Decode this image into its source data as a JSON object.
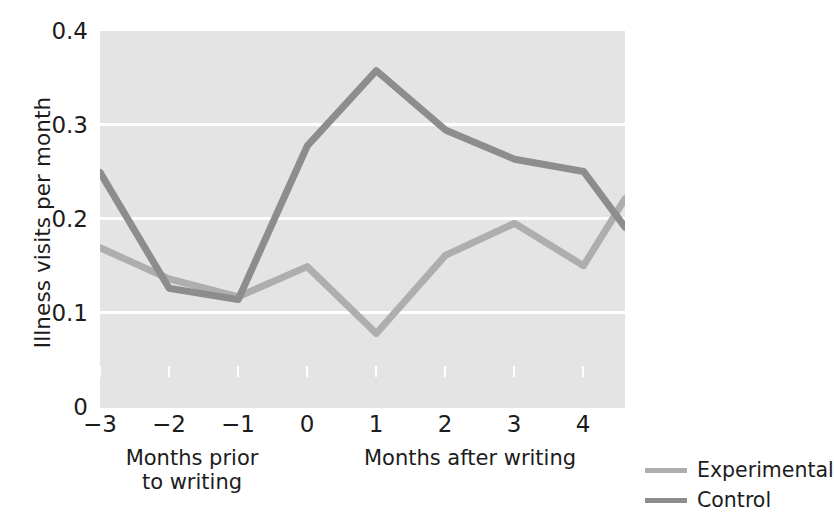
{
  "chart_data": {
    "type": "line",
    "title": "",
    "xlabel": "",
    "ylabel": "Illness visits per month",
    "x": [
      -3,
      -2,
      -1,
      0,
      1,
      2,
      3,
      4,
      4.6
    ],
    "x_tick_labels": [
      "−3",
      "−2",
      "−1",
      "0",
      "1",
      "2",
      "3",
      "4"
    ],
    "x_tick_values": [
      -3,
      -2,
      -1,
      0,
      1,
      2,
      3,
      4
    ],
    "y_tick_labels": [
      "0",
      "0.1",
      "0.2",
      "0.3",
      "0.4"
    ],
    "y_tick_values": [
      0,
      0.1,
      0.2,
      0.3,
      0.4
    ],
    "ylim": [
      0,
      0.4
    ],
    "xlim": [
      -3,
      4.6
    ],
    "grid": "horizontal-white-gridlines-at-0.1-0.2-0.3",
    "legend_position": "right-outside-bottom",
    "plot_background": "#e4e4e4",
    "series": [
      {
        "name": "Experimental",
        "color": "#aeaeae",
        "values": [
          0.17,
          0.137,
          0.118,
          0.15,
          0.079,
          0.162,
          0.196,
          0.151,
          0.222
        ]
      },
      {
        "name": "Control",
        "color": "#8d8d8d",
        "values": [
          0.25,
          0.127,
          0.115,
          0.278,
          0.358,
          0.295,
          0.264,
          0.251,
          0.192
        ]
      }
    ],
    "annotations": [
      {
        "text": "Months prior to writing",
        "region": "x from -3 to 0"
      },
      {
        "text": "Months after writing",
        "region": "x from 0 to 4.6"
      }
    ]
  },
  "axes": {
    "y_label": "Illness visits per month",
    "y_ticks": [
      "0.4",
      "0.3",
      "0.2",
      "0.1",
      "0"
    ],
    "x_ticks": [
      "−3",
      "−2",
      "−1",
      "0",
      "1",
      "2",
      "3",
      "4"
    ],
    "caption_prior_line1": "Months prior",
    "caption_prior_line2": "to writing",
    "caption_after": "Months after writing"
  },
  "legend": {
    "items": [
      {
        "label": "Experimental",
        "color": "#aeaeae"
      },
      {
        "label": "Control",
        "color": "#8d8d8d"
      }
    ]
  }
}
